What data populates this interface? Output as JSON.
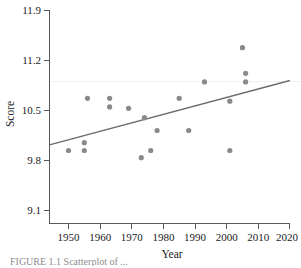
{
  "figure": {
    "caption_partial": "FIGURE 1.1  Scatterplot of ..."
  },
  "chart_data": {
    "type": "scatter",
    "title": "",
    "xlabel": "Year",
    "ylabel": "Score",
    "xlim": [
      1944,
      2020
    ],
    "ylim": [
      8.85,
      11.9
    ],
    "xticks": [
      1950,
      1960,
      1970,
      1980,
      1990,
      2000,
      2010,
      2020
    ],
    "xtick_labels": [
      "1950",
      "1960",
      "1970",
      "1980",
      "1990",
      "2000",
      "2010",
      "2020"
    ],
    "yticks": [
      9.1,
      9.8,
      10.5,
      11.2,
      11.9
    ],
    "ytick_labels": [
      "9.1",
      "9.8",
      "10.5",
      "11.2",
      "11.9"
    ],
    "grid": false,
    "legend": null,
    "marker_color": "#8a8a8a",
    "line_color": "#6b6b6b",
    "axis_color": "#575757",
    "points": [
      {
        "x": 1950,
        "y": 9.94
      },
      {
        "x": 1955,
        "y": 10.05
      },
      {
        "x": 1955,
        "y": 9.94
      },
      {
        "x": 1956,
        "y": 10.67
      },
      {
        "x": 1963,
        "y": 10.67
      },
      {
        "x": 1963,
        "y": 10.55
      },
      {
        "x": 1969,
        "y": 10.53
      },
      {
        "x": 1973,
        "y": 9.84
      },
      {
        "x": 1974,
        "y": 10.4
      },
      {
        "x": 1976,
        "y": 9.94
      },
      {
        "x": 1978,
        "y": 10.22
      },
      {
        "x": 1985,
        "y": 10.67
      },
      {
        "x": 1988,
        "y": 10.22
      },
      {
        "x": 1993,
        "y": 10.9
      },
      {
        "x": 2001,
        "y": 10.63
      },
      {
        "x": 2001,
        "y": 9.94
      },
      {
        "x": 2005,
        "y": 11.38
      },
      {
        "x": 2006,
        "y": 11.02
      },
      {
        "x": 2006,
        "y": 10.9
      }
    ],
    "trend_line": {
      "type": "linear-fit",
      "x_start": 1944,
      "y_start": 10.02,
      "x_end": 2020,
      "y_end": 10.92
    }
  }
}
